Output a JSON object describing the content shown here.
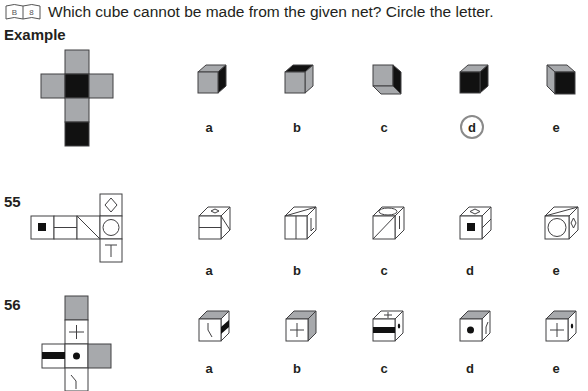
{
  "header": {
    "book_icon_letters": [
      "B",
      "8"
    ],
    "instruction": "Which cube cannot be made from the given net? Circle the letter."
  },
  "example": {
    "label": "Example",
    "net_faces": [
      "grey",
      "grey",
      "black",
      "grey",
      "grey",
      "black"
    ],
    "options": [
      {
        "label": "a",
        "circled": false
      },
      {
        "label": "b",
        "circled": false
      },
      {
        "label": "c",
        "circled": false
      },
      {
        "label": "d",
        "circled": true
      },
      {
        "label": "e",
        "circled": false
      }
    ]
  },
  "questions": [
    {
      "number": "55",
      "net_faces": [
        "black square",
        "horizontal line",
        "diagonal line",
        "diamond",
        "circle",
        "T"
      ],
      "options": [
        {
          "label": "a",
          "circled": false
        },
        {
          "label": "b",
          "circled": false
        },
        {
          "label": "c",
          "circled": false
        },
        {
          "label": "d",
          "circled": false
        },
        {
          "label": "e",
          "circled": false
        }
      ]
    },
    {
      "number": "56",
      "net_faces": [
        "grey",
        "plus",
        "black bar",
        "dot",
        "grey",
        "bent line"
      ],
      "options": [
        {
          "label": "a",
          "circled": false
        },
        {
          "label": "b",
          "circled": false
        },
        {
          "label": "c",
          "circled": false
        },
        {
          "label": "d",
          "circled": false
        },
        {
          "label": "e",
          "circled": false
        }
      ]
    }
  ],
  "colors": {
    "grey": "#a7a9ac",
    "black": "#111111",
    "line": "#414042",
    "circle": "#8a8a8a"
  }
}
